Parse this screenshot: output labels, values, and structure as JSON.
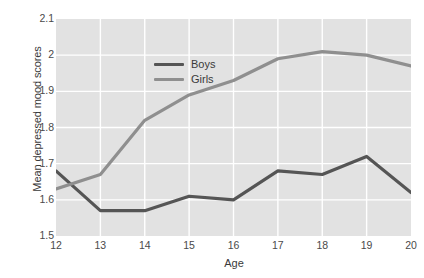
{
  "chart_data": {
    "type": "line",
    "title": "",
    "xlabel": "Age",
    "ylabel": "Mean depressed mood scores",
    "categories": [
      12,
      13,
      14,
      15,
      16,
      17,
      18,
      19,
      20
    ],
    "x": [
      12,
      13,
      14,
      15,
      16,
      17,
      18,
      19,
      20
    ],
    "xticklabels": [
      "12",
      "13",
      "14",
      "15",
      "16",
      "17",
      "18",
      "19",
      "20"
    ],
    "yticklabels": [
      "2.1",
      "2",
      "1.9",
      "1.8",
      "1.7",
      "1.6",
      "1.5"
    ],
    "yticks": [
      2.1,
      2.0,
      1.9,
      1.8,
      1.7,
      1.6,
      1.5
    ],
    "xlim": [
      12,
      20
    ],
    "ylim": [
      1.5,
      2.1
    ],
    "grid": true,
    "grid_color": "#ffffff",
    "plot_background": "#e2e2e2",
    "legend_position": "top-left-inside",
    "series": [
      {
        "name": "Boys",
        "color": "#555555",
        "values": [
          1.68,
          1.57,
          1.57,
          1.61,
          1.6,
          1.68,
          1.67,
          1.72,
          1.62
        ]
      },
      {
        "name": "Girls",
        "color": "#8f8f8f",
        "values": [
          1.63,
          1.67,
          1.82,
          1.89,
          1.93,
          1.99,
          2.01,
          2.0,
          1.97
        ]
      }
    ]
  }
}
